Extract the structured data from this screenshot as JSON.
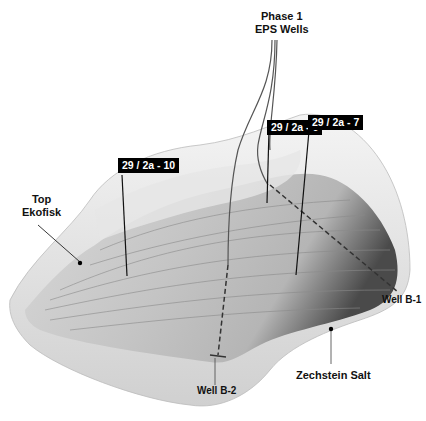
{
  "figure": {
    "type": "3D seismic surface diagram",
    "colors": {
      "surface_light": "#f2f2f2",
      "surface_mid": "#bdbdbd",
      "surface_dark": "#5a5a5a",
      "label_bg": "#000000",
      "label_text": "#ffffff",
      "line": "#222222"
    }
  },
  "labels": {
    "phase_title_line1": "Phase 1",
    "phase_title_line2": "EPS Wells",
    "top_ekofisk_line1": "Top",
    "top_ekofisk_line2": "Ekofisk",
    "zechstein": "Zechstein Salt",
    "well_b1": "Well B-1",
    "well_b2": "Well B-2"
  },
  "wells": [
    {
      "name": "29 / 2a - 10"
    },
    {
      "name": "29 / 2a - 6"
    },
    {
      "name": "29 / 2a - 7"
    }
  ]
}
